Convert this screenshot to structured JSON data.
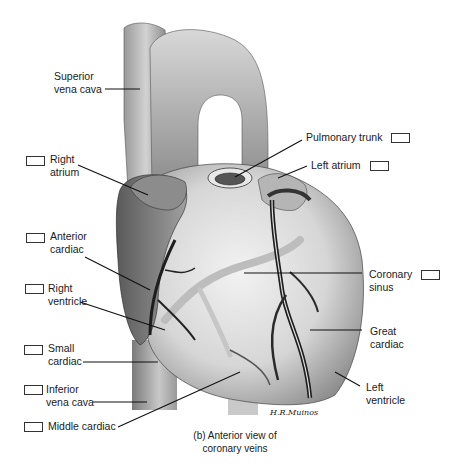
{
  "figure": {
    "caption_line1": "(b) Anterior view of",
    "caption_line2": "coronary veins",
    "signature": "H.R.Muinos"
  },
  "labels": {
    "superior_vena_cava": {
      "line1": "Superior",
      "line2": "vena cava",
      "has_box": false
    },
    "right_atrium": {
      "line1": "Right",
      "line2": "atrium",
      "has_box": true
    },
    "anterior_cardiac": {
      "line1": "Anterior",
      "line2": "cardiac",
      "has_box": true
    },
    "right_ventricle": {
      "line1": "Right",
      "line2": "ventricle",
      "has_box": true
    },
    "small_cardiac": {
      "line1": "Small",
      "line2": "cardiac",
      "has_box": true
    },
    "inferior_vena_cava": {
      "line1": "Inferior",
      "line2": "vena cava",
      "has_box": true
    },
    "middle_cardiac": {
      "line1": "Middle cardiac",
      "has_box": true
    },
    "pulmonary_trunk": {
      "line1": "Pulmonary trunk",
      "has_box": true
    },
    "left_atrium": {
      "line1": "Left atrium",
      "has_box": true
    },
    "coronary_sinus": {
      "line1": "Coronary",
      "line2": "sinus",
      "has_box": true
    },
    "great_cardiac": {
      "line1": "Great",
      "line2": "cardiac",
      "has_box": false
    },
    "left_ventricle": {
      "line1": "Left",
      "line2": "ventricle",
      "has_box": false
    }
  },
  "colors": {
    "ink": "#1a1a1a",
    "vessel_dark": "#6f6f6f",
    "vessel_mid": "#a8a8a8",
    "heart_light": "#e4e4e4",
    "vein_dark": "#2a2a2a",
    "vein_pale": "#bdbdbd"
  }
}
